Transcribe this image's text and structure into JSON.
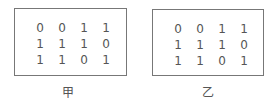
{
  "figures": [
    {
      "label": "甲",
      "matrix": [
        [
          "0",
          "0",
          "1",
          "1"
        ],
        [
          "1",
          "1",
          "1",
          "0"
        ],
        [
          "1",
          "1",
          "0",
          "1"
        ]
      ]
    },
    {
      "label": "乙",
      "matrix": [
        [
          "0",
          "0",
          "1",
          "1"
        ],
        [
          "1",
          "1",
          "1",
          "0"
        ],
        [
          "1",
          "1",
          "0",
          "1"
        ]
      ]
    }
  ]
}
